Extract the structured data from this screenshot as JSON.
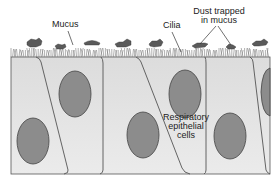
{
  "labels": {
    "mucus": "Mucus",
    "cilia": "Cilia",
    "dust_line1": "Dust trapped",
    "dust_line2": "in mucus",
    "cells_line1": "Respiratory",
    "cells_line2": "epithelial",
    "cells_line3": "cells"
  },
  "colors": {
    "cell_fill": "#e4e4e4",
    "cell_border": "#555555",
    "nucleus_fill": "#8c8c8c",
    "nucleus_border": "#444444",
    "cilia": "#777777",
    "mucus_clump": "#5a5a5a"
  },
  "nuclei": [
    {
      "cx": 75,
      "cy": 94,
      "rx": 16,
      "ry": 23
    },
    {
      "cx": 33,
      "cy": 141,
      "rx": 16,
      "ry": 23
    },
    {
      "cx": 143,
      "cy": 135,
      "rx": 16,
      "ry": 23
    },
    {
      "cx": 185,
      "cy": 94,
      "rx": 16,
      "ry": 24
    },
    {
      "cx": 230,
      "cy": 136,
      "rx": 16,
      "ry": 23
    },
    {
      "cx": 272,
      "cy": 92,
      "rx": 10,
      "ry": 24
    }
  ]
}
